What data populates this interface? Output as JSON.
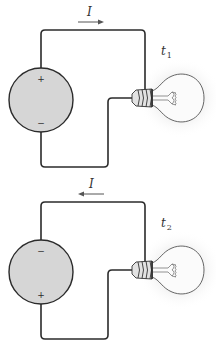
{
  "diagram": {
    "type": "circuit",
    "circuits": [
      {
        "id": "circuit-1",
        "current_label": "I",
        "current_direction": "right",
        "time_label": "t",
        "time_subscript": "1",
        "battery_top_terminal": "+",
        "battery_bottom_terminal": "−"
      },
      {
        "id": "circuit-2",
        "current_label": "I",
        "current_direction": "left",
        "time_label": "t",
        "time_subscript": "2",
        "battery_top_terminal": "−",
        "battery_bottom_terminal": "+"
      }
    ]
  }
}
